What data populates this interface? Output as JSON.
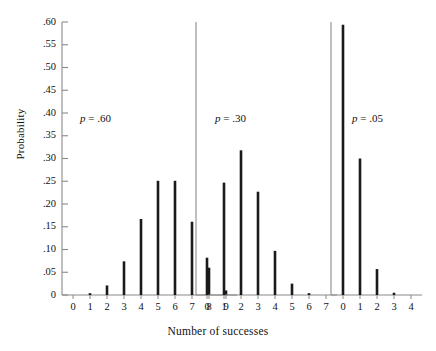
{
  "figure": {
    "ylabel": "Probability",
    "xlabel": "Number of successes",
    "y_ticks": [
      ".60",
      ".55",
      ".50",
      ".45",
      ".40",
      ".35",
      ".30",
      ".25",
      ".20",
      ".15",
      ".10",
      ".05",
      "0"
    ],
    "y_tick_values": [
      0.6,
      0.55,
      0.5,
      0.45,
      0.4,
      0.35,
      0.3,
      0.25,
      0.2,
      0.15,
      0.1,
      0.05,
      0
    ],
    "line_color": "#1a1a1a",
    "axis_color": "#8a8a8a",
    "background": "#ffffff"
  },
  "panels": [
    {
      "note_p": "p",
      "note_eq": "=",
      "note_value": ".60",
      "note_text": "p = .60",
      "x_ticks": [
        "0",
        "1",
        "2",
        "3",
        "4",
        "5",
        "6",
        "7",
        "8",
        "9"
      ]
    },
    {
      "note_p": "p",
      "note_eq": "=",
      "note_value": ".30",
      "note_text": "p = .30",
      "x_ticks": [
        "0",
        "1",
        "2",
        "3",
        "4",
        "5",
        "6",
        "7"
      ]
    },
    {
      "note_p": "p",
      "note_eq": "=",
      "note_value": ".05",
      "note_text": "p = .05",
      "x_ticks": [
        "0",
        "1",
        "2",
        "3",
        "4"
      ]
    }
  ],
  "chart_data": {
    "type": "bar",
    "title": "",
    "xlabel": "Number of successes",
    "ylabel": "Probability",
    "ylim": [
      0,
      0.6
    ],
    "grid": false,
    "legend": "none",
    "panels": [
      {
        "name": "p = .60",
        "annotation": "p = .60",
        "n": 9,
        "p": 0.6,
        "categories": [
          0,
          1,
          2,
          3,
          4,
          5,
          6,
          7,
          8,
          9
        ],
        "values": [
          0.0,
          0.004,
          0.021,
          0.074,
          0.167,
          0.251,
          0.251,
          0.161,
          0.06,
          0.01
        ]
      },
      {
        "name": "p = .30",
        "annotation": "p = .30",
        "n": 7,
        "p": 0.3,
        "categories": [
          0,
          1,
          2,
          3,
          4,
          5,
          6,
          7
        ],
        "values": [
          0.082,
          0.247,
          0.318,
          0.227,
          0.097,
          0.025,
          0.004,
          0.0
        ]
      },
      {
        "name": "p = .05",
        "annotation": "p = .05",
        "n": 4,
        "p": 0.05,
        "categories": [
          0,
          1,
          2,
          3,
          4
        ],
        "values": [
          0.594,
          0.3,
          0.057,
          0.005,
          0.0
        ]
      }
    ]
  }
}
